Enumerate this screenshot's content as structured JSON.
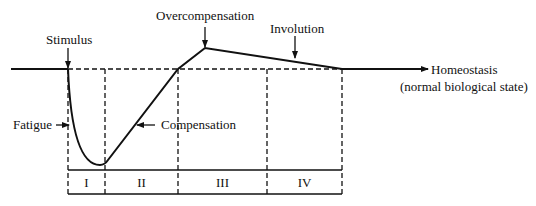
{
  "diagram": {
    "type": "supercompensation-cycle",
    "labels": {
      "stimulus": "Stimulus",
      "overcompensation": "Overcompensation",
      "involution": "Involution",
      "fatigue": "Fatigue",
      "compensation": "Compensation",
      "homeostasis_line1": "Homeostasis",
      "homeostasis_line2": "(normal biological state)"
    },
    "phases": [
      "I",
      "II",
      "III",
      "IV"
    ],
    "colors": {
      "ink": "#111111",
      "background": "#ffffff"
    }
  }
}
